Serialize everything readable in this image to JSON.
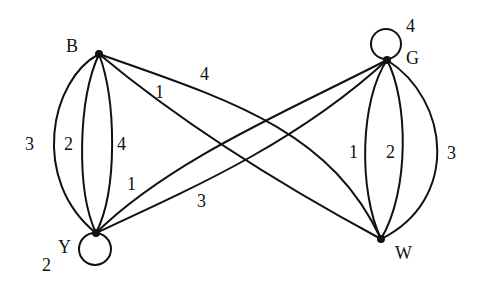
{
  "graph": {
    "nodes": [
      {
        "id": "B",
        "label": "B",
        "x": 99,
        "y": 54,
        "label_x": 66,
        "label_y": 52
      },
      {
        "id": "G",
        "label": "G",
        "x": 387,
        "y": 60,
        "label_x": 406,
        "label_y": 64
      },
      {
        "id": "Y",
        "label": "Y",
        "x": 96,
        "y": 233,
        "label_x": 58,
        "label_y": 253
      },
      {
        "id": "W",
        "label": "W",
        "x": 381,
        "y": 239,
        "label_x": 395,
        "label_y": 259
      }
    ],
    "edges": [
      {
        "from": "B",
        "to": "Y",
        "weight": "3"
      },
      {
        "from": "B",
        "to": "Y",
        "weight": "2"
      },
      {
        "from": "B",
        "to": "Y",
        "weight": "4"
      },
      {
        "from": "B",
        "to": "W",
        "weight": "1"
      },
      {
        "from": "B",
        "to": "W",
        "weight": "4"
      },
      {
        "from": "Y",
        "to": "G",
        "weight": "1"
      },
      {
        "from": "Y",
        "to": "G",
        "weight": "3"
      },
      {
        "from": "G",
        "to": "W",
        "weight": "1"
      },
      {
        "from": "G",
        "to": "W",
        "weight": "2"
      },
      {
        "from": "G",
        "to": "W",
        "weight": "3"
      },
      {
        "from": "G",
        "to": "G",
        "weight": "4"
      },
      {
        "from": "Y",
        "to": "Y",
        "weight": "2"
      }
    ],
    "labels": {
      "by_outer": "3",
      "by_middle": "2",
      "by_inner": "4",
      "bw_lower": "1",
      "bw_upper": "4",
      "yg_upper": "1",
      "yg_lower": "3",
      "gw_left": "1",
      "gw_middle": "2",
      "gw_right": "3",
      "g_loop": "4",
      "y_loop": "2",
      "node_b": "B",
      "node_g": "G",
      "node_y": "Y",
      "node_w": "W"
    }
  }
}
